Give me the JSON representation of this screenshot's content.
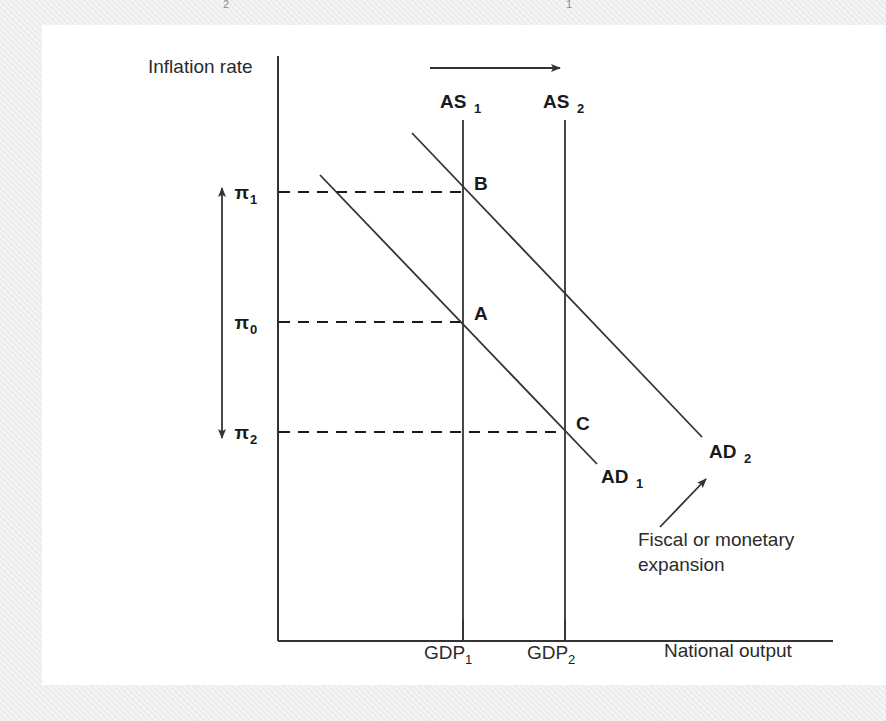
{
  "figure": {
    "type": "economics-ad-as-diagram",
    "top_edge_remnants": [
      "2",
      "1"
    ],
    "axes": {
      "y_axis_label": "Inflation rate",
      "x_axis_label": "National output",
      "y_ticks": [
        {
          "base": "π",
          "sub": "1",
          "y_px": 192
        },
        {
          "base": "π",
          "sub": "0",
          "y_px": 322
        },
        {
          "base": "π",
          "sub": "2",
          "y_px": 432
        }
      ],
      "x_ticks": [
        {
          "base": "GDP",
          "sub": "1",
          "x_px": 463
        },
        {
          "base": "GDP",
          "sub": "2",
          "x_px": 565
        }
      ]
    },
    "curves": [
      {
        "name": "AS1",
        "base": "AS",
        "sub": "1",
        "kind": "vertical-supply"
      },
      {
        "name": "AS2",
        "base": "AS",
        "sub": "2",
        "kind": "vertical-supply"
      },
      {
        "name": "AD1",
        "base": "AD",
        "sub": "1",
        "kind": "downward-demand"
      },
      {
        "name": "AD2",
        "base": "AD",
        "sub": "2",
        "kind": "downward-demand"
      }
    ],
    "equilibrium_points": [
      {
        "label": "A",
        "on": "AS1 x AD1",
        "x_px": 463,
        "y_px": 322
      },
      {
        "label": "B",
        "on": "AS1 x AD2",
        "x_px": 463,
        "y_px": 192
      },
      {
        "label": "C",
        "on": "AS2 x AD1",
        "x_px": 565,
        "y_px": 432
      }
    ],
    "annotations": [
      {
        "name": "expansion-note",
        "line1": "Fiscal or monetary",
        "line2": "expansion"
      }
    ],
    "arrows": [
      {
        "name": "supply-shift-arrow",
        "direction": "right"
      },
      {
        "name": "inflation-range-arrow",
        "direction": "up-down"
      },
      {
        "name": "expansion-pointer-arrow",
        "direction": "up-right"
      }
    ],
    "colors": {
      "line": "#333333",
      "text": "#1a1a1a",
      "panel": "#ffffff",
      "outer": "#eeeeee"
    }
  }
}
